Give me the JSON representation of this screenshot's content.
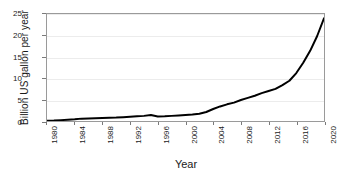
{
  "chart_data": {
    "type": "line",
    "title": "",
    "xlabel": "Year",
    "ylabel": "Billion US gallon per year",
    "xlim": [
      1980,
      2020
    ],
    "ylim": [
      0,
      25
    ],
    "grid": true,
    "legend": null,
    "y_ticks": [
      0,
      5,
      10,
      15,
      20,
      25
    ],
    "y_tick_labels": [
      "0",
      "5",
      "10",
      "15",
      "20",
      "25"
    ],
    "x_ticks": [
      1980,
      1984,
      1988,
      1992,
      1996,
      2000,
      2004,
      2008,
      2012,
      2016,
      2020
    ],
    "x_tick_labels": [
      "1980",
      "1984",
      "1988",
      "1992",
      "1996",
      "2000",
      "2004",
      "2008",
      "2012",
      "2016",
      "2020"
    ],
    "series": [
      {
        "name": "Billion US gallon per year",
        "color": "#000000",
        "line_width": 2,
        "x": [
          1980,
          1981,
          1982,
          1983,
          1984,
          1985,
          1986,
          1987,
          1988,
          1989,
          1990,
          1991,
          1992,
          1993,
          1994,
          1995,
          1996,
          1997,
          1998,
          1999,
          2000,
          2001,
          2002,
          2003,
          2004,
          2005,
          2006,
          2007,
          2008,
          2009,
          2010,
          2011,
          2012,
          2013,
          2014,
          2015,
          2016,
          2017,
          2018,
          2019,
          2020
        ],
        "y": [
          0.05,
          0.1,
          0.2,
          0.3,
          0.4,
          0.55,
          0.6,
          0.65,
          0.7,
          0.75,
          0.8,
          0.9,
          1.0,
          1.1,
          1.2,
          1.4,
          1.05,
          1.1,
          1.2,
          1.3,
          1.4,
          1.5,
          1.7,
          2.1,
          2.8,
          3.4,
          3.9,
          4.3,
          4.9,
          5.4,
          5.9,
          6.5,
          7.0,
          7.5,
          8.4,
          9.4,
          11.2,
          13.6,
          16.4,
          19.8,
          24.0
        ]
      }
    ]
  }
}
